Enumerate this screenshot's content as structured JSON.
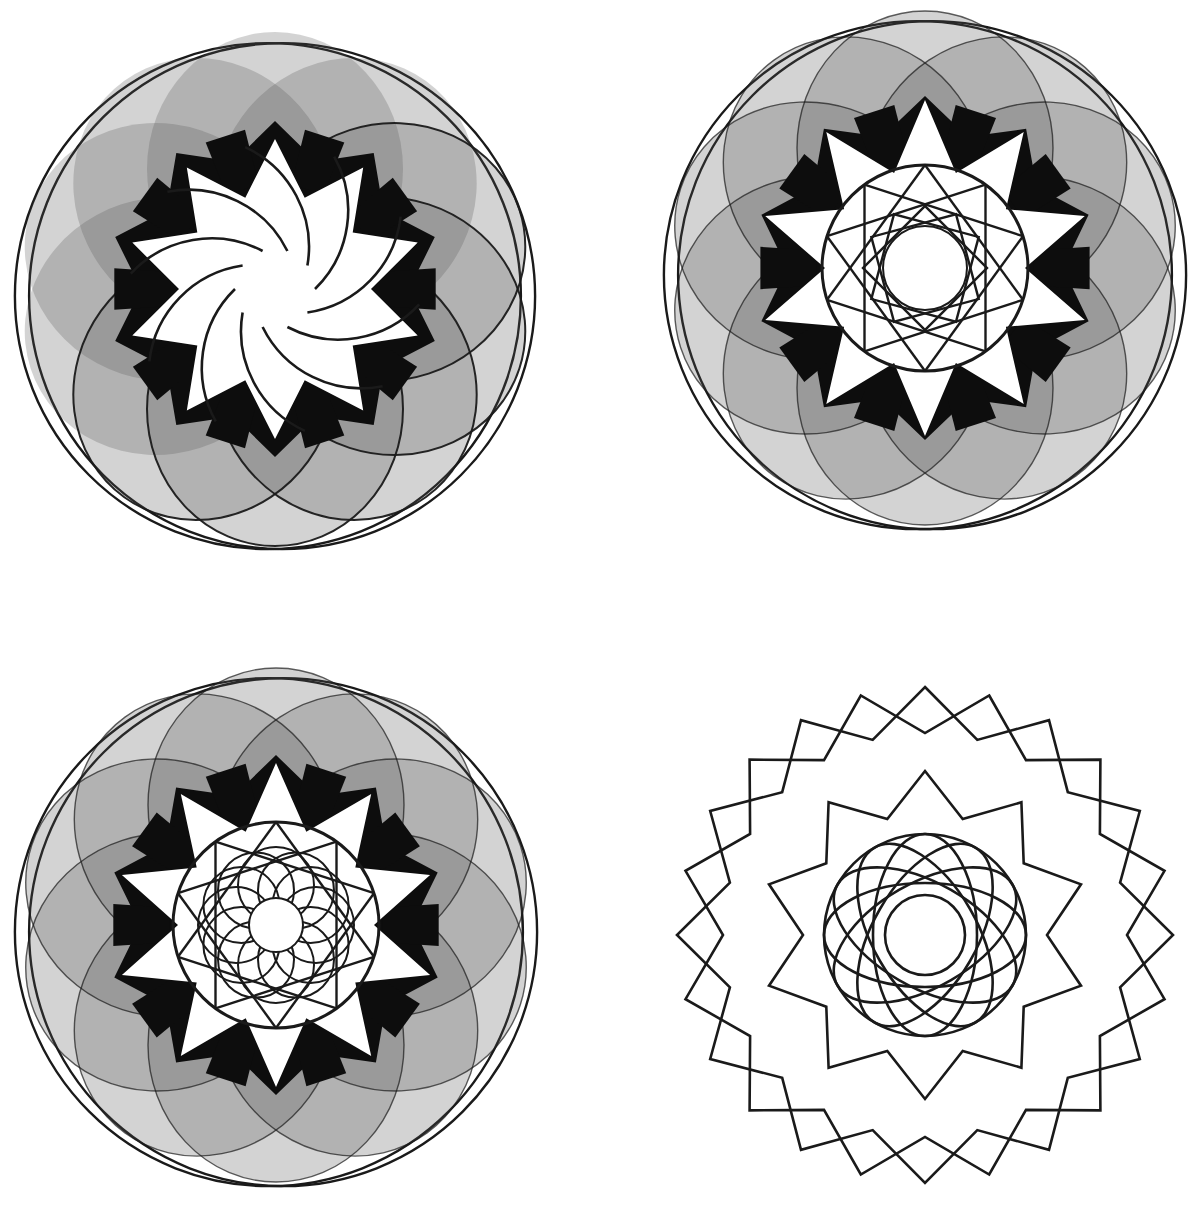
{
  "canvas": {
    "width": 1194,
    "height": 1223,
    "background": "#ffffff"
  },
  "colors": {
    "stroke": "#1a1a1a",
    "gray_fill": "#555555",
    "gray_opacity": 0.26,
    "black": "#0d0d0d",
    "white": "#ffffff"
  },
  "figures": [
    {
      "id": "top-left-rosette",
      "cx": 275,
      "cy": 289,
      "outline_radius": 257,
      "petal_count": 10,
      "petal_offset": 120,
      "petal_rx": 137,
      "petal_ry": 128,
      "filled": true,
      "outer_outline_circles": true,
      "center_style": "spiral",
      "white_star_outer": 150,
      "white_star_inner": 96,
      "black_ring_outer": 168,
      "spiral_arc_count": 10,
      "spiral_radius": 110,
      "center_hole": 40,
      "inner_polygons": []
    },
    {
      "id": "top-right-rosette",
      "cx": 925,
      "cy": 268,
      "outline_radius": 258,
      "petal_count": 10,
      "petal_offset": 120,
      "petal_rx": 137,
      "petal_ry": 128,
      "filled": true,
      "outer_outline_circles": true,
      "center_style": "polygons",
      "white_star_outer": 168,
      "white_star_inner": 100,
      "black_ring_outer": 172,
      "center_hole": 42,
      "inner_polygons": [
        {
          "type": "circle",
          "r": 103
        },
        {
          "type": "star-lines",
          "points": 10,
          "r": 103,
          "skip": 3
        },
        {
          "type": "squares",
          "count": 3,
          "r": 62
        }
      ]
    },
    {
      "id": "bottom-left-rosette",
      "cx": 276,
      "cy": 925,
      "outline_radius": 258,
      "petal_count": 10,
      "petal_offset": 120,
      "petal_rx": 137,
      "petal_ry": 128,
      "filled": true,
      "outer_outline_circles": true,
      "center_style": "polygons",
      "white_star_outer": 162,
      "white_star_inner": 98,
      "black_ring_outer": 170,
      "center_hole": 27,
      "inner_polygons": [
        {
          "type": "circle",
          "r": 103
        },
        {
          "type": "star-lines",
          "points": 10,
          "r": 103,
          "skip": 3
        },
        {
          "type": "ring-circles",
          "count": 12,
          "offset": 40,
          "r": 38
        }
      ]
    },
    {
      "id": "bottom-right-outline-rosette",
      "cx": 925,
      "cy": 935,
      "outline_radius": 248,
      "petal_count": 10,
      "filled": false,
      "outer_outline_circles": false,
      "center_style": "outline",
      "wavy_outer": {
        "points": 12,
        "r_out": 248,
        "r_in": 202,
        "lobes": 2
      },
      "wavy_inner": {
        "points": 10,
        "r_out": 164,
        "r_in": 122
      },
      "ring": {
        "r": 101,
        "ellipse_count": 6,
        "ellipse_rx": 101,
        "ellipse_ry": 52
      },
      "center_hole": 40
    }
  ],
  "caption": {
    "visible_text": ""
  }
}
